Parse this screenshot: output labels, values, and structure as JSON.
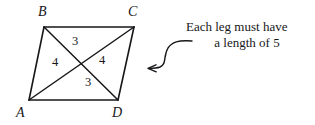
{
  "figure": {
    "type": "geometry-diagram",
    "shape": "parallelogram",
    "vertices": [
      {
        "label": "B",
        "x": 44,
        "y": 27,
        "label_x": 38,
        "label_y": 5
      },
      {
        "label": "C",
        "x": 134,
        "y": 27,
        "label_x": 128,
        "label_y": 5
      },
      {
        "label": "A",
        "x": 29,
        "y": 100,
        "label_x": 16,
        "label_y": 106
      },
      {
        "label": "D",
        "x": 118,
        "y": 100,
        "label_x": 112,
        "label_y": 106
      }
    ],
    "sides": [
      "AB",
      "BC",
      "CD",
      "DA"
    ],
    "diagonals": [
      "AC",
      "BD"
    ],
    "segment_labels": [
      {
        "text": "3",
        "x": 72,
        "y": 35
      },
      {
        "text": "4",
        "x": 52,
        "y": 56
      },
      {
        "text": "4",
        "x": 99,
        "y": 54
      },
      {
        "text": "3",
        "x": 85,
        "y": 76
      }
    ],
    "stroke_color": "#17171a"
  },
  "annotation": {
    "line_1": "Each leg must have",
    "line_2": "a length of 5",
    "arrow": {
      "name": "curved-arrow",
      "points_to": "parallelogram",
      "direction": "left"
    }
  }
}
